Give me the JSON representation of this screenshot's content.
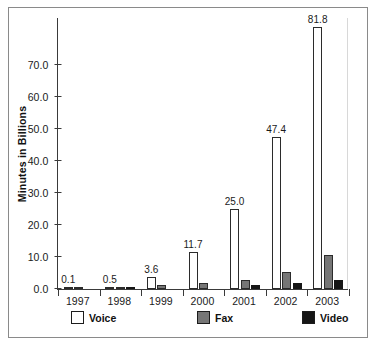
{
  "chart_data": {
    "type": "bar",
    "title": "",
    "subtitle": "",
    "xlabel": "",
    "ylabel": "Minutes in Billions",
    "ylim": [
      0,
      85
    ],
    "yticks": [
      0.0,
      10.0,
      20.0,
      30.0,
      40.0,
      50.0,
      60.0,
      70.0
    ],
    "ytick_labels": [
      "0.0",
      "10.0",
      "20.0",
      "30.0",
      "40.0",
      "50.0",
      "60.0",
      "70.0"
    ],
    "grid": false,
    "legend_position": "bottom",
    "categories": [
      "1997",
      "1998",
      "1999",
      "2000",
      "2001",
      "2002",
      "2003"
    ],
    "series": [
      {
        "name": "Voice",
        "color": "#ffffff",
        "values": [
          0.1,
          0.5,
          3.6,
          11.7,
          25.0,
          47.4,
          81.8
        ],
        "data_labels": [
          "0.1",
          "0.5",
          "3.6",
          "11.7",
          "25.0",
          "47.4",
          "81.8"
        ]
      },
      {
        "name": "Fax",
        "color": "#767676",
        "values": [
          0.1,
          0.6,
          1.1,
          1.8,
          2.9,
          5.4,
          10.5
        ],
        "data_labels": [
          "",
          "",
          "",
          "",
          "",
          "",
          ""
        ]
      },
      {
        "name": "Video",
        "color": "#161616",
        "values": [
          0.0,
          0.7,
          0.0,
          0.0,
          1.4,
          2.0,
          2.8
        ],
        "data_labels": [
          "",
          "",
          "",
          "",
          "",
          "",
          ""
        ]
      }
    ],
    "annotations": []
  },
  "legend": {
    "items": [
      {
        "label": "Voice",
        "swatch": "voice"
      },
      {
        "label": "Fax",
        "swatch": "fax"
      },
      {
        "label": "Video",
        "swatch": "video"
      }
    ]
  }
}
